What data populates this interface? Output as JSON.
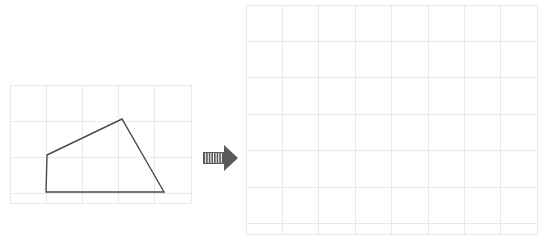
{
  "canvas": {
    "width": 546,
    "height": 244,
    "background": "#ffffff"
  },
  "colors": {
    "grid_line": "#e9e9e9",
    "grid_line_major": "#e2e2e2",
    "shape_stroke": "#4a4a4a",
    "shape_fill": "none",
    "arrow_fill": "#5a5a5a",
    "arrow_stripe": "#ffffff"
  },
  "title": "Translate the shape onto the empty grid",
  "left_panel": {
    "name": "source-grid",
    "label": "Source grid with quadrilateral",
    "grid": {
      "x": 10,
      "y": 85,
      "cell": 36.2,
      "cols": 5,
      "rows": 3.26,
      "width": 181,
      "height": 118,
      "line_color": "#e9e9e9",
      "line_width": 1
    },
    "shape": {
      "name": "quadrilateral",
      "type": "polygon",
      "vertex_count": 4,
      "stroke": "#4a4a4a",
      "stroke_width": 1.4,
      "fill": "none",
      "points": [
        {
          "label": "A",
          "x": 47,
          "y": 155
        },
        {
          "label": "B",
          "x": 122,
          "y": 119
        },
        {
          "label": "C",
          "x": 164,
          "y": 192
        },
        {
          "label": "D",
          "x": 46,
          "y": 192
        }
      ],
      "points_string": "47,155 122,119 164,192 46,192"
    }
  },
  "arrow": {
    "name": "transform-arrow",
    "label": "arrow pointing right",
    "direction": "right",
    "x": 203,
    "y": 145,
    "width": 35,
    "height": 26,
    "fill": "#5a5a5a",
    "stripe_count": 7,
    "stripe_color": "#ffffff"
  },
  "right_panel": {
    "name": "target-grid",
    "label": "Empty target grid",
    "grid": {
      "x": 246,
      "y": 5,
      "cell": 36.4,
      "cols": 8,
      "rows": 6.3,
      "width": 291,
      "height": 229,
      "line_color": "#e9e9e9",
      "line_width": 1
    },
    "shape": null
  }
}
